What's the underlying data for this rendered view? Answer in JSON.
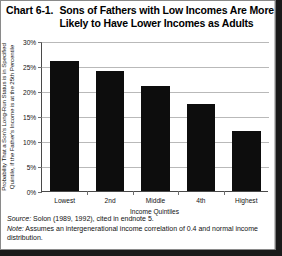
{
  "chart_label": "Chart 6-1.",
  "title_line1": "Sons of Fathers with Low Incomes Are More",
  "title_line2": "Likely to Have Lower Incomes as Adults",
  "yaxis_title_line1": "Probability That a Son's Long-Run Status is in Specified",
  "yaxis_title_line2": "Quintile, if the Father's Income is at the 25th Percentile",
  "xaxis_title": "Income Quintiles",
  "yticks": [
    "0%",
    "5%",
    "10%",
    "15%",
    "20%",
    "25%",
    "30%"
  ],
  "source_label": "Source:",
  "source_text": " Solon (1989, 1992), cited in endnote 5.",
  "note_label": "Note:",
  "note_text": " Assumes an intergenerational income correlation of 0.4 and normal income distribution.",
  "colors": {
    "bar": "#0d0d0d",
    "grid": "#b9b9b9",
    "axis": "#4a4a4a",
    "frame_shadow": "#1a1a1a"
  },
  "chart_data": {
    "type": "bar",
    "title": "Chart 6-1. Sons of Fathers with Low Incomes Are More Likely to Have Lower Incomes as Adults",
    "xlabel": "Income Quintiles",
    "ylabel": "Probability That a Son's Long-Run Status is in Specified Quintile, if the Father's Income is at the 25th Percentile",
    "categories": [
      "Lowest",
      "2nd",
      "Middle",
      "4th",
      "Highest"
    ],
    "values": [
      26,
      24,
      21,
      17.5,
      12
    ],
    "value_labels": [
      "26%",
      "24%",
      "21%",
      "17.5%",
      "12%"
    ],
    "ylim": [
      0,
      30
    ],
    "ytick_values": [
      0,
      5,
      10,
      15,
      20,
      25,
      30
    ],
    "ytick_labels": [
      "0%",
      "5%",
      "10%",
      "15%",
      "20%",
      "25%",
      "30%"
    ],
    "grid": true,
    "grid_axis": "y",
    "legend": false,
    "bar_color": "#0d0d0d",
    "units": "percent"
  }
}
